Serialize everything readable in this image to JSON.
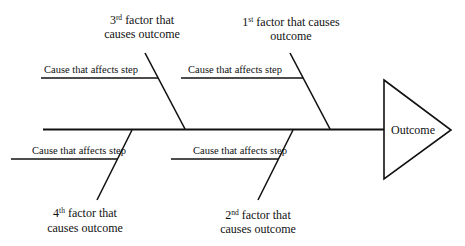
{
  "diagram": {
    "type": "fishbone",
    "outcome": {
      "label": "Outcome"
    },
    "factors": [
      {
        "id": "1",
        "ordinal_number": "1",
        "ordinal_suffix": "st",
        "line1_rest": " factor that causes",
        "line2": "outcome",
        "position": "top-right",
        "causes": [
          {
            "label": "Cause that affects step"
          }
        ]
      },
      {
        "id": "2",
        "ordinal_number": "2",
        "ordinal_suffix": "nd",
        "line1_rest": " factor that",
        "line2": "causes outcome",
        "position": "bottom-right",
        "causes": [
          {
            "label": "Cause that affects step"
          }
        ]
      },
      {
        "id": "3",
        "ordinal_number": "3",
        "ordinal_suffix": "rd",
        "line1_rest": " factor that",
        "line2": "causes outcome",
        "position": "top-left",
        "causes": [
          {
            "label": "Cause that affects step"
          }
        ]
      },
      {
        "id": "4",
        "ordinal_number": "4",
        "ordinal_suffix": "th",
        "line1_rest": " factor that",
        "line2": "causes outcome",
        "position": "bottom-left",
        "causes": [
          {
            "label": "Cause that affects step"
          }
        ]
      }
    ],
    "colors": {
      "line": "#111111",
      "background": "#ffffff"
    }
  }
}
